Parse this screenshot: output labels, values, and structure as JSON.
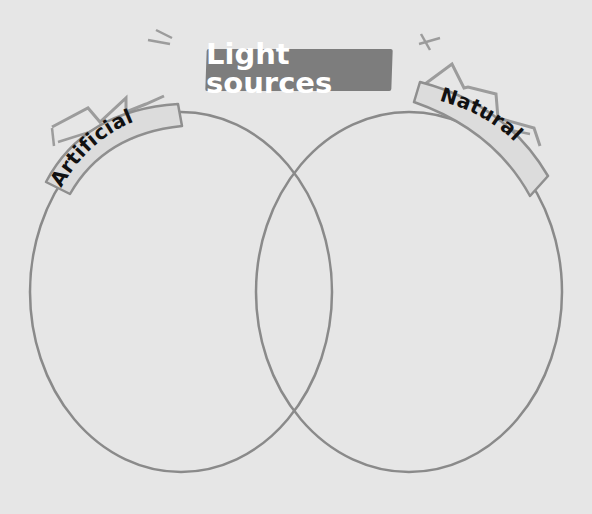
{
  "title": "Light sources",
  "labels": {
    "left": "Artificial",
    "right": "Natural"
  },
  "colors": {
    "background": "#e6e6e6",
    "title_box": "#7d7d7d",
    "title_text": "#ffffff",
    "outline": "#8a8a8a",
    "label_fill": "#dcdcdc",
    "label_text": "#111111",
    "zigzag": "#9a9a9a"
  },
  "diagram": {
    "type": "venn",
    "sets": [
      "Artificial",
      "Natural"
    ],
    "left_set_contents": [],
    "right_set_contents": [],
    "intersection_contents": []
  }
}
